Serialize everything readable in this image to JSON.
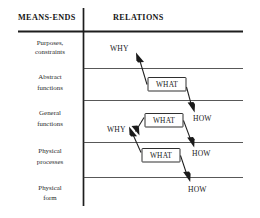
{
  "figure": {
    "headers": {
      "left": "MEANS-ENDS",
      "right": "RELATIONS"
    },
    "levels": [
      {
        "line1": "Purposes,",
        "line2": "constraints"
      },
      {
        "line1": "Abstract",
        "line2": "functions"
      },
      {
        "line1": "General",
        "line2": "functions"
      },
      {
        "line1": "Physical",
        "line2": "processes"
      },
      {
        "line1": "Physical",
        "line2": "form"
      }
    ],
    "why_labels": [
      "WHY",
      "WHY",
      "WHY"
    ],
    "what_labels": [
      "WHAT",
      "WHAT",
      "WHAT"
    ],
    "how_labels": [
      "HOW",
      "HOW",
      "HOW"
    ],
    "colors": {
      "ink": "#1a1a1a",
      "rule": "#3a3a3a",
      "background": "#ffffff"
    }
  }
}
